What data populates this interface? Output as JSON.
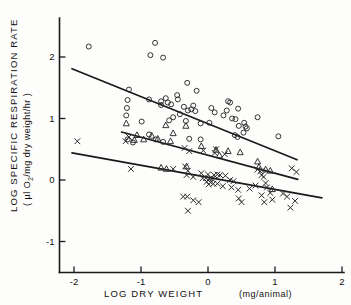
{
  "chart_data": {
    "type": "scatter",
    "title": "",
    "xlabel": "LOG DRY WEIGHT (mg/animal)",
    "xlabel_main": "LOG  DRY  WEIGHT",
    "xlabel_units": "(mg/animal)",
    "ylabel": "LOG SPECIFIC RESPIRATION RATE",
    "ylabel_units": "(µl O2/mg dry weight/hr)",
    "ylabel_units_pre": "( µl O",
    "ylabel_units_sub": "2",
    "ylabel_units_post": "/mg dry weight/hr )",
    "xlim": [
      -2.35,
      2.0
    ],
    "ylim": [
      -1.35,
      2.45
    ],
    "xticks": [
      -2,
      -1,
      0,
      1,
      2
    ],
    "xtick_labels": [
      "-2",
      "-1",
      "0",
      "1",
      "2"
    ],
    "yticks": [
      -1,
      0,
      1,
      2
    ],
    "ytick_labels": [
      "-1",
      "0",
      "1",
      "2"
    ],
    "grid": false,
    "legend": "none",
    "series": [
      {
        "name": "circles",
        "marker": "open-circle",
        "points": [
          [
            -1.78,
            2.17
          ],
          [
            -0.79,
            2.23
          ],
          [
            -0.86,
            2.03
          ],
          [
            -0.67,
            1.99
          ],
          [
            -0.31,
            1.58
          ],
          [
            -1.18,
            1.47
          ],
          [
            -1.2,
            1.3
          ],
          [
            -0.88,
            1.31
          ],
          [
            -0.17,
            1.45
          ],
          [
            -0.63,
            1.33
          ],
          [
            -0.7,
            1.28
          ],
          [
            -0.7,
            1.22
          ],
          [
            -0.6,
            1.26
          ],
          [
            -0.55,
            1.23
          ],
          [
            -0.46,
            1.38
          ],
          [
            -0.45,
            1.31
          ],
          [
            -0.36,
            1.19
          ],
          [
            -0.3,
            1.13
          ],
          [
            -0.25,
            1.15
          ],
          [
            -0.22,
            1.21
          ],
          [
            -0.19,
            1.12
          ],
          [
            0.3,
            1.28
          ],
          [
            0.33,
            1.26
          ],
          [
            0.28,
            1.13
          ],
          [
            0.45,
            1.16
          ],
          [
            -1.21,
            1.17
          ],
          [
            -1.22,
            1.05
          ],
          [
            -0.99,
            0.95
          ],
          [
            -0.58,
            0.97
          ],
          [
            -0.52,
            1.02
          ],
          [
            -0.42,
            1.07
          ],
          [
            -0.33,
            0.96
          ],
          [
            -0.11,
            0.92
          ],
          [
            0.02,
            0.93
          ],
          [
            0.23,
            1.05
          ],
          [
            0.36,
            1.0
          ],
          [
            0.41,
            0.99
          ],
          [
            0.46,
            0.88
          ],
          [
            0.56,
            0.87
          ],
          [
            0.74,
            1.02
          ],
          [
            0.54,
            0.93
          ],
          [
            0.58,
            0.84
          ],
          [
            0.53,
            0.77
          ],
          [
            0.44,
            0.7
          ],
          [
            0.4,
            0.73
          ],
          [
            1.05,
            0.71
          ],
          [
            -1.2,
            0.66
          ],
          [
            -1.12,
            0.61
          ],
          [
            -0.78,
            0.66
          ],
          [
            -0.67,
            0.62
          ],
          [
            -0.28,
            0.67
          ],
          [
            -0.11,
            0.66
          ],
          [
            -0.88,
            0.74
          ],
          [
            0.05,
            1.17
          ],
          [
            0.1,
            1.1
          ]
        ]
      },
      {
        "name": "triangles",
        "marker": "open-triangle",
        "points": [
          [
            -1.22,
            0.92
          ],
          [
            -1.06,
            0.73
          ],
          [
            -1.1,
            0.65
          ],
          [
            -0.96,
            0.66
          ],
          [
            -0.84,
            0.72
          ],
          [
            -0.75,
            0.67
          ],
          [
            -0.63,
            0.89
          ],
          [
            -0.52,
            0.76
          ],
          [
            -0.56,
            0.63
          ],
          [
            -0.33,
            0.88
          ],
          [
            -0.7,
            0.2
          ],
          [
            -0.32,
            0.22
          ],
          [
            -0.1,
            0.55
          ],
          [
            0.17,
            0.4
          ],
          [
            0.3,
            0.47
          ],
          [
            0.48,
            0.45
          ],
          [
            0.76,
            0.21
          ],
          [
            0.86,
            0.17
          ],
          [
            0.93,
            0.15
          ],
          [
            0.74,
            0.3
          ],
          [
            -0.62,
            0.18
          ],
          [
            0.96,
            -0.15
          ],
          [
            0.12,
            0.49
          ]
        ]
      },
      {
        "name": "crosses",
        "marker": "cross",
        "points": [
          [
            -1.95,
            0.63
          ],
          [
            -1.18,
            0.7
          ],
          [
            -1.23,
            0.63
          ],
          [
            -1.15,
            0.18
          ],
          [
            -0.35,
            0.52
          ],
          [
            -0.28,
            0.47
          ],
          [
            -0.07,
            0.48
          ],
          [
            0.12,
            0.5
          ],
          [
            0.1,
            0.44
          ],
          [
            0.25,
            0.42
          ],
          [
            -0.34,
            0.22
          ],
          [
            -0.3,
            0.15
          ],
          [
            -0.32,
            0.08
          ],
          [
            -0.22,
            0.05
          ],
          [
            -0.1,
            0.11
          ],
          [
            -0.08,
            0.03
          ],
          [
            -0.03,
            0.03
          ],
          [
            -0.02,
            -0.03
          ],
          [
            0.02,
            0.02
          ],
          [
            0.04,
            -0.04
          ],
          [
            0.06,
            0.02
          ],
          [
            0.0,
            0.09
          ],
          [
            0.09,
            0.08
          ],
          [
            0.14,
            0.09
          ],
          [
            0.18,
            0.08
          ],
          [
            0.26,
            0.07
          ],
          [
            0.01,
            -0.07
          ],
          [
            0.08,
            -0.06
          ],
          [
            0.14,
            -0.06
          ],
          [
            0.22,
            -0.1
          ],
          [
            0.35,
            -0.12
          ],
          [
            0.45,
            -0.16
          ],
          [
            0.62,
            -0.14
          ],
          [
            0.71,
            -0.09
          ],
          [
            0.74,
            0.17
          ],
          [
            0.78,
            0.14
          ],
          [
            0.8,
            0.08
          ],
          [
            0.83,
            0.05
          ],
          [
            0.86,
            -0.05
          ],
          [
            0.88,
            -0.12
          ],
          [
            0.93,
            -0.21
          ],
          [
            0.96,
            -0.32
          ],
          [
            1.12,
            -0.22
          ],
          [
            1.18,
            -0.27
          ],
          [
            1.23,
            -0.45
          ],
          [
            1.3,
            -0.34
          ],
          [
            1.25,
            0.19
          ],
          [
            1.32,
            0.13
          ],
          [
            -0.37,
            -0.27
          ],
          [
            -0.31,
            -0.27
          ],
          [
            -0.22,
            -0.33
          ],
          [
            -0.14,
            -0.36
          ],
          [
            -0.3,
            -0.5
          ],
          [
            0.46,
            -0.3
          ],
          [
            0.5,
            -0.36
          ],
          [
            0.8,
            -0.25
          ],
          [
            0.84,
            -0.36
          ],
          [
            -0.52,
            0.18
          ],
          [
            0.33,
            0.0
          ],
          [
            0.38,
            -0.02
          ]
        ]
      }
    ],
    "fit_lines": [
      {
        "name": "circles-fit",
        "x0": -2.03,
        "y0": 1.81,
        "x1": 1.33,
        "y1": 0.33
      },
      {
        "name": "triangles-fit",
        "x0": -1.29,
        "y0": 0.78,
        "x1": 1.34,
        "y1": 0.01
      },
      {
        "name": "crosses-fit",
        "x0": -2.03,
        "y0": 0.44,
        "x1": 1.7,
        "y1": -0.29
      }
    ]
  },
  "colors": {
    "ink": "#1a1a1a",
    "marker": "#2a2a2a",
    "background": "#fdfdfb"
  }
}
